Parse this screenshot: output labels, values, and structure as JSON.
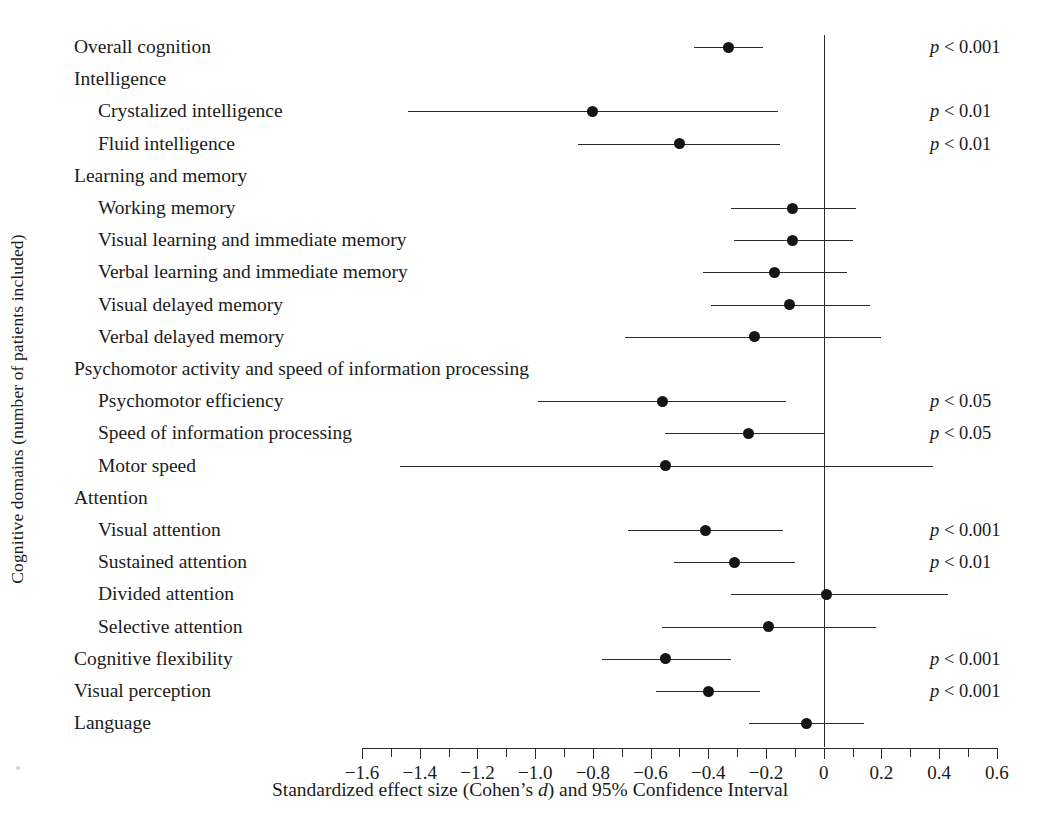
{
  "axis_title_y": "Cognitive domains (number of patients included)",
  "axis_title_x_pre": "Standardized effect size (Cohen’s ",
  "axis_title_x_italic": "d",
  "axis_title_x_post": ") and 95% Confidence Interval",
  "p_prefix": "p",
  "p_operator": " < ",
  "chart_data": {
    "type": "scatter",
    "subtype": "forest-plot",
    "title": "",
    "xlabel": "Standardized effect size (Cohen’s d) and 95% Confidence Interval",
    "ylabel": "Cognitive domains (number of patients included)",
    "xlim": [
      -1.7,
      0.62
    ],
    "xticks": [
      -1.6,
      -1.5,
      -1.4,
      -1.3,
      -1.2,
      -1.1,
      -1.0,
      -0.9,
      -0.8,
      -0.7,
      -0.6,
      -0.5,
      -0.4,
      -0.3,
      -0.2,
      -0.1,
      0,
      0.1,
      0.2,
      0.3,
      0.4,
      0.5,
      0.6
    ],
    "xticklabels": [
      "−1.6",
      "",
      "−1.4",
      "",
      "−1.2",
      "",
      "−1.0",
      "",
      "−0.8",
      "",
      "−0.6",
      "",
      "−0.4",
      "",
      "−0.2",
      "",
      "0",
      "",
      "0.2",
      "",
      "0.4",
      "",
      "0.6"
    ],
    "reference_line": 0,
    "grid": false,
    "legend": "none",
    "rows": [
      {
        "label": "Overall cognition",
        "level": 0,
        "d": -0.33,
        "ci_low": -0.45,
        "ci_high": -0.21,
        "p": "0.001"
      },
      {
        "label": "Intelligence",
        "level": 0,
        "d": null,
        "ci_low": null,
        "ci_high": null,
        "p": ""
      },
      {
        "label": "Crystalized intelligence",
        "level": 1,
        "d": -0.8,
        "ci_low": -1.44,
        "ci_high": -0.16,
        "p": "0.01"
      },
      {
        "label": "Fluid intelligence",
        "level": 1,
        "d": -0.5,
        "ci_low": -0.85,
        "ci_high": -0.15,
        "p": "0.01"
      },
      {
        "label": "Learning and memory",
        "level": 0,
        "d": null,
        "ci_low": null,
        "ci_high": null,
        "p": ""
      },
      {
        "label": "Working memory",
        "level": 1,
        "d": -0.11,
        "ci_low": -0.32,
        "ci_high": 0.11,
        "p": ""
      },
      {
        "label": "Visual learning and immediate memory",
        "level": 1,
        "d": -0.11,
        "ci_low": -0.31,
        "ci_high": 0.1,
        "p": ""
      },
      {
        "label": "Verbal learning and immediate memory",
        "level": 1,
        "d": -0.17,
        "ci_low": -0.42,
        "ci_high": 0.08,
        "p": ""
      },
      {
        "label": "Visual delayed memory",
        "level": 1,
        "d": -0.12,
        "ci_low": -0.39,
        "ci_high": 0.16,
        "p": ""
      },
      {
        "label": "Verbal delayed memory",
        "level": 1,
        "d": -0.24,
        "ci_low": -0.69,
        "ci_high": 0.2,
        "p": ""
      },
      {
        "label": "Psychomotor activity and speed of information processing",
        "level": 0,
        "d": null,
        "ci_low": null,
        "ci_high": null,
        "p": ""
      },
      {
        "label": "Psychomotor efficiency",
        "level": 1,
        "d": -0.56,
        "ci_low": -0.99,
        "ci_high": -0.13,
        "p": "0.05"
      },
      {
        "label": "Speed of information processing",
        "level": 1,
        "d": -0.26,
        "ci_low": -0.55,
        "ci_high": 0.0,
        "p": "0.05"
      },
      {
        "label": "Motor speed",
        "level": 1,
        "d": -0.55,
        "ci_low": -1.47,
        "ci_high": 0.38,
        "p": ""
      },
      {
        "label": "Attention",
        "level": 0,
        "d": null,
        "ci_low": null,
        "ci_high": null,
        "p": ""
      },
      {
        "label": "Visual attention",
        "level": 1,
        "d": -0.41,
        "ci_low": -0.68,
        "ci_high": -0.14,
        "p": "0.001"
      },
      {
        "label": "Sustained attention",
        "level": 1,
        "d": -0.31,
        "ci_low": -0.52,
        "ci_high": -0.1,
        "p": "0.01"
      },
      {
        "label": "Divided attention",
        "level": 1,
        "d": 0.01,
        "ci_low": -0.32,
        "ci_high": 0.43,
        "p": ""
      },
      {
        "label": "Selective attention",
        "level": 1,
        "d": -0.19,
        "ci_low": -0.56,
        "ci_high": 0.18,
        "p": ""
      },
      {
        "label": "Cognitive flexibility",
        "level": 0,
        "d": -0.55,
        "ci_low": -0.77,
        "ci_high": -0.32,
        "p": "0.001"
      },
      {
        "label": "Visual perception",
        "level": 0,
        "d": -0.4,
        "ci_low": -0.58,
        "ci_high": -0.22,
        "p": "0.001"
      },
      {
        "label": "Language",
        "level": 0,
        "d": -0.06,
        "ci_low": -0.26,
        "ci_high": 0.14,
        "p": ""
      }
    ]
  }
}
